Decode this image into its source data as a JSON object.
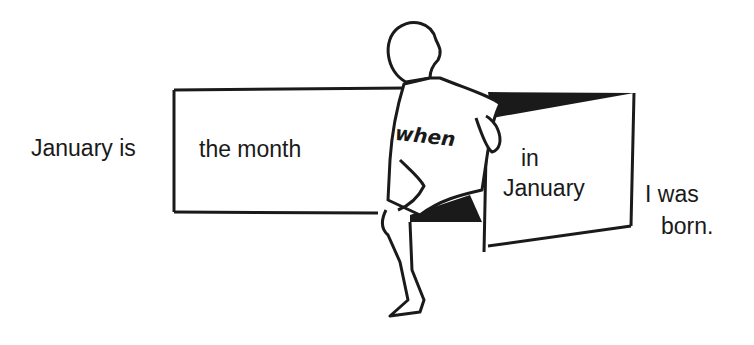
{
  "diagram": {
    "type": "grammar-illustration",
    "left_text": "January is",
    "left_box_text": "the month",
    "figure_shirt_text": "when",
    "right_box_line1": "in",
    "right_box_line2": "January",
    "trailing_line1": "I was",
    "trailing_line2": "born."
  },
  "colors": {
    "ink": "#1a1a1a",
    "background": "#ffffff"
  }
}
